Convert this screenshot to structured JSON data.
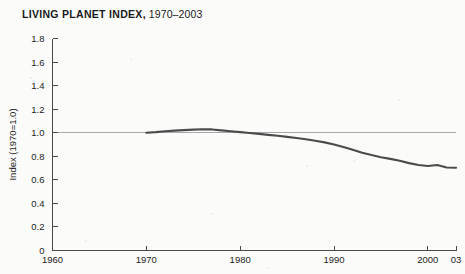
{
  "title": {
    "bold": "LIVING PLANET INDEX,",
    "regular": " 1970–2003"
  },
  "colors": {
    "background": "#fbfbfa",
    "line": "#4b4b4b",
    "axis": "#4a4a4a",
    "reference_line": "#a9a9a9",
    "text": "#1d1d1d"
  },
  "chart_data": {
    "type": "line",
    "title": "LIVING PLANET INDEX, 1970–2003",
    "xlabel": "",
    "ylabel": "Index (1970=1.0)",
    "xlim": [
      1960,
      2003
    ],
    "ylim": [
      0,
      1.8
    ],
    "grid": false,
    "legend": null,
    "x_ticks": [
      1960,
      1970,
      1980,
      1990,
      2000,
      2003
    ],
    "x_tick_labels": [
      "1960",
      "1970",
      "1980",
      "1990",
      "2000",
      "03"
    ],
    "y_ticks": [
      0,
      0.2,
      0.4,
      0.6,
      0.8,
      1.0,
      1.2,
      1.4,
      1.6,
      1.8
    ],
    "y_tick_labels": [
      "0",
      "0.2",
      "0.4",
      "0.6",
      "0.8",
      "1.0",
      "1.2",
      "1.4",
      "1.6",
      "1.8"
    ],
    "reference_line": {
      "y": 1.0,
      "x_start": 1960,
      "x_end": 2003
    },
    "series": [
      {
        "name": "Living Planet Index",
        "x": [
          1970,
          1971,
          1972,
          1973,
          1974,
          1975,
          1976,
          1977,
          1978,
          1979,
          1980,
          1981,
          1982,
          1983,
          1984,
          1985,
          1986,
          1987,
          1988,
          1989,
          1990,
          1991,
          1992,
          1993,
          1994,
          1995,
          1996,
          1997,
          1998,
          1999,
          2000,
          2001,
          2002,
          2003
        ],
        "values": [
          1.0,
          1.005,
          1.012,
          1.018,
          1.022,
          1.026,
          1.03,
          1.028,
          1.02,
          1.012,
          1.005,
          0.998,
          0.99,
          0.982,
          0.974,
          0.965,
          0.955,
          0.945,
          0.932,
          0.918,
          0.9,
          0.878,
          0.855,
          0.83,
          0.81,
          0.792,
          0.778,
          0.762,
          0.742,
          0.726,
          0.718,
          0.726,
          0.705,
          0.702
        ]
      }
    ]
  }
}
